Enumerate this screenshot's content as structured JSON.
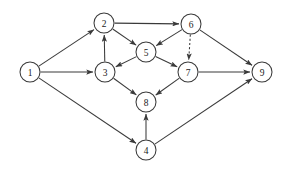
{
  "diagram": {
    "type": "directed-graph",
    "width": 288,
    "height": 171,
    "background_color": "#ffffff",
    "stroke_color": "#3a3a3a",
    "node_fill_color": "#ffffff",
    "label_color": "#1a1a1a",
    "node_radius": 10,
    "nodes": [
      {
        "id": "1",
        "label": "1",
        "x": 30,
        "y": 72
      },
      {
        "id": "2",
        "label": "2",
        "x": 104,
        "y": 23
      },
      {
        "id": "3",
        "label": "3",
        "x": 105,
        "y": 72
      },
      {
        "id": "4",
        "label": "4",
        "x": 146,
        "y": 150
      },
      {
        "id": "5",
        "label": "5",
        "x": 146,
        "y": 52
      },
      {
        "id": "6",
        "label": "6",
        "x": 191,
        "y": 24
      },
      {
        "id": "7",
        "label": "7",
        "x": 188,
        "y": 72
      },
      {
        "id": "8",
        "label": "8",
        "x": 146,
        "y": 102
      },
      {
        "id": "9",
        "label": "9",
        "x": 262,
        "y": 72
      }
    ],
    "edges": [
      {
        "from": "1",
        "to": "2",
        "style": "solid",
        "directed": true
      },
      {
        "from": "1",
        "to": "3",
        "style": "solid",
        "directed": true
      },
      {
        "from": "1",
        "to": "4",
        "style": "solid",
        "directed": true
      },
      {
        "from": "3",
        "to": "2",
        "style": "solid",
        "directed": true
      },
      {
        "from": "2",
        "to": "6",
        "style": "solid",
        "directed": true
      },
      {
        "from": "2",
        "to": "5",
        "style": "solid",
        "directed": true
      },
      {
        "from": "6",
        "to": "5",
        "style": "solid",
        "directed": true
      },
      {
        "from": "6",
        "to": "7",
        "style": "dashed",
        "directed": true
      },
      {
        "from": "6",
        "to": "9",
        "style": "solid",
        "directed": true
      },
      {
        "from": "5",
        "to": "3",
        "style": "solid",
        "directed": true
      },
      {
        "from": "5",
        "to": "7",
        "style": "solid",
        "directed": true
      },
      {
        "from": "3",
        "to": "8",
        "style": "solid",
        "directed": true
      },
      {
        "from": "7",
        "to": "8",
        "style": "solid",
        "directed": true
      },
      {
        "from": "7",
        "to": "9",
        "style": "solid",
        "directed": true
      },
      {
        "from": "4",
        "to": "8",
        "style": "solid",
        "directed": true
      },
      {
        "from": "4",
        "to": "9",
        "style": "solid",
        "directed": true
      }
    ]
  }
}
